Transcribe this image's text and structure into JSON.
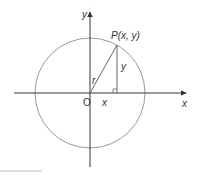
{
  "diagram": {
    "colors": {
      "circle": "#9a9a9a",
      "axes": "#333333",
      "lines": "#666666",
      "text": "#333333",
      "footer_rule": "#bbbbbb"
    },
    "labels": {
      "y_axis": "y",
      "x_axis": "x",
      "point": "P(x, y)",
      "vertical_leg": "y",
      "radius": "r",
      "origin": "O",
      "horizontal_leg": "x"
    },
    "geometry": {
      "origin": [
        90,
        93
      ],
      "radius": 55,
      "point_P": [
        117,
        45
      ]
    }
  }
}
